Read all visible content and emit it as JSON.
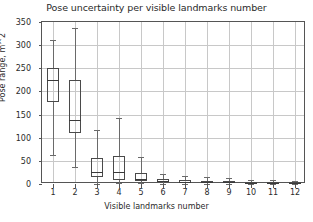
{
  "chart_data": {
    "type": "box",
    "title": "Pose uncertainty per visible landmarks number",
    "xlabel": "Visible landmarks number",
    "ylabel": "Pose range, m^2",
    "ylim": [
      0,
      350
    ],
    "yticks": [
      0,
      50,
      100,
      150,
      200,
      250,
      300,
      350
    ],
    "ytick_labels": [
      "0",
      "50",
      "100",
      "150",
      "200",
      "250",
      "300",
      "350"
    ],
    "categories": [
      "1",
      "2",
      "3",
      "4",
      "5",
      "6",
      "7",
      "8",
      "9",
      "10",
      "11",
      "12"
    ],
    "grid": true,
    "legend": "none",
    "boxes": [
      {
        "category": "1",
        "whisker_low": 63,
        "q1": 177,
        "median": 224,
        "q3": 251,
        "whisker_high": 312
      },
      {
        "category": "2",
        "whisker_low": 37,
        "q1": 111,
        "median": 138,
        "q3": 224,
        "whisker_high": 337
      },
      {
        "category": "3",
        "whisker_low": 1,
        "q1": 15,
        "median": 27,
        "q3": 56,
        "whisker_high": 117
      },
      {
        "category": "4",
        "whisker_low": 2,
        "q1": 9,
        "median": 27,
        "q3": 61,
        "whisker_high": 142
      },
      {
        "category": "5",
        "whisker_low": 2,
        "q1": 6,
        "median": 10,
        "q3": 23,
        "whisker_high": 59
      },
      {
        "category": "6",
        "whisker_low": 1,
        "q1": 4,
        "median": 7,
        "q3": 11,
        "whisker_high": 21
      },
      {
        "category": "7",
        "whisker_low": 1,
        "q1": 3,
        "median": 5,
        "q3": 8,
        "whisker_high": 17
      },
      {
        "category": "8",
        "whisker_low": 1,
        "q1": 3,
        "median": 5,
        "q3": 7,
        "whisker_high": 15
      },
      {
        "category": "9",
        "whisker_low": 1,
        "q1": 2,
        "median": 4,
        "q3": 6,
        "whisker_high": 13
      },
      {
        "category": "10",
        "whisker_low": 1,
        "q1": 2,
        "median": 3,
        "q3": 5,
        "whisker_high": 9
      },
      {
        "category": "11",
        "whisker_low": 1,
        "q1": 2,
        "median": 3,
        "q3": 4,
        "whisker_high": 8
      },
      {
        "category": "12",
        "whisker_low": 1,
        "q1": 2,
        "median": 3,
        "q3": 4,
        "whisker_high": 7
      }
    ]
  },
  "style": {
    "background": "#ffffff",
    "axis_color": "#555555",
    "grid_color": "#c8c8c8",
    "box_edge_color": "#4a4a4a",
    "median_color": "#3a3a3a",
    "whisker_color": "#6a6a6a",
    "text_color": "#2a2a2a"
  }
}
